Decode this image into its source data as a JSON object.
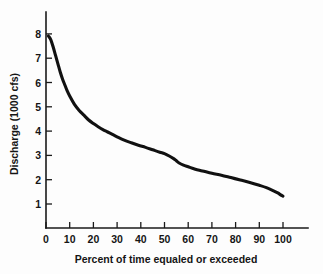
{
  "chart_data": {
    "type": "line",
    "title": "",
    "xlabel": "Percent of time equaled or exceeded",
    "ylabel": "Discharge (1000 cfs)",
    "xlim": [
      0,
      110
    ],
    "ylim": [
      0,
      8.7
    ],
    "grid": false,
    "legend": null,
    "xticks": [
      0,
      10,
      20,
      30,
      40,
      50,
      60,
      70,
      80,
      90,
      100
    ],
    "xtick_labels": [
      "0",
      "10",
      "20",
      "30",
      "40",
      "50",
      "60",
      "70",
      "80",
      "90",
      "100"
    ],
    "yticks": [
      1,
      2,
      3,
      4,
      5,
      6,
      7,
      8
    ],
    "ytick_labels": [
      "1",
      "2",
      "3",
      "4",
      "5",
      "6",
      "7",
      "8"
    ],
    "series": [
      {
        "name": "Flow duration curve",
        "color": "#111111",
        "x": [
          1,
          2,
          3,
          4,
          5,
          6,
          7,
          8,
          9,
          10,
          12,
          14,
          16,
          18,
          20,
          22,
          24,
          26,
          28,
          30,
          33,
          36,
          39,
          42,
          45,
          48,
          50,
          52,
          54,
          55,
          56,
          58,
          60,
          63,
          66,
          70,
          74,
          78,
          82,
          86,
          90,
          93,
          96,
          98,
          99,
          100
        ],
        "y": [
          8.0,
          7.85,
          7.55,
          7.2,
          6.85,
          6.5,
          6.2,
          5.95,
          5.7,
          5.5,
          5.15,
          4.9,
          4.7,
          4.5,
          4.35,
          4.22,
          4.1,
          4.0,
          3.9,
          3.8,
          3.66,
          3.55,
          3.45,
          3.36,
          3.26,
          3.16,
          3.1,
          3.0,
          2.88,
          2.8,
          2.72,
          2.62,
          2.55,
          2.45,
          2.38,
          2.28,
          2.2,
          2.1,
          2.0,
          1.9,
          1.78,
          1.68,
          1.55,
          1.45,
          1.38,
          1.33
        ]
      }
    ]
  },
  "axes": {
    "x_title": "Percent of time equaled or exceeded",
    "y_title": "Discharge (1000 cfs)"
  },
  "xtick_labels": {
    "t0": "0",
    "t1": "10",
    "t2": "20",
    "t3": "30",
    "t4": "40",
    "t5": "50",
    "t6": "60",
    "t7": "70",
    "t8": "80",
    "t9": "90",
    "t10": "100"
  },
  "ytick_labels": {
    "t1": "1",
    "t2": "2",
    "t3": "3",
    "t4": "4",
    "t5": "5",
    "t6": "6",
    "t7": "7",
    "t8": "8"
  },
  "colors": {
    "curve": "#111111",
    "axis": "#1a1a1a",
    "background": "#fdfdfd"
  }
}
